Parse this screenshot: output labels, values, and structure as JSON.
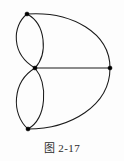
{
  "figure": {
    "caption_prefix": "图",
    "caption_chapter": "2",
    "caption_dash": "-",
    "caption_number": "17",
    "caption_full": "图 2-17",
    "background_color": "#fdfdfd",
    "ink_color": "#1a1a1a",
    "vertex_color": "#000000"
  },
  "chart_data": {
    "type": "diagram",
    "vertices": [
      {
        "id": "v_top",
        "label": "",
        "x": 27,
        "y": 14
      },
      {
        "id": "v_center",
        "label": "",
        "x": 35,
        "y": 68
      },
      {
        "id": "v_right",
        "label": "",
        "x": 110,
        "y": 68
      },
      {
        "id": "v_bottom",
        "label": "",
        "x": 28,
        "y": 129
      }
    ],
    "edges": [
      {
        "id": "e1",
        "from": "v_top",
        "to": "v_center",
        "shape": "arc-left",
        "path": "M 27 14 C 12 26 11 54 35 68"
      },
      {
        "id": "e2",
        "from": "v_top",
        "to": "v_center",
        "shape": "arc-right",
        "path": "M 27 14 C 46 24 48 54 35 68"
      },
      {
        "id": "e3",
        "from": "v_center",
        "to": "v_bottom",
        "shape": "arc-left",
        "path": "M 35 68 C 12 82 11 114 28 129"
      },
      {
        "id": "e4",
        "from": "v_center",
        "to": "v_bottom",
        "shape": "arc-right",
        "path": "M 35 68 C 48 84 47 118 28 129"
      },
      {
        "id": "e5",
        "from": "v_center",
        "to": "v_right",
        "shape": "straight",
        "path": "M 35 68 L 110 68"
      },
      {
        "id": "e6",
        "from": "v_top",
        "to": "v_right",
        "shape": "arc-outer-top",
        "path": "M 27 14 C 72 11 110 33 110 68"
      },
      {
        "id": "e7",
        "from": "v_right",
        "to": "v_bottom",
        "shape": "arc-outer-bot",
        "path": "M 110 68 C 110 106 70 129 28 129"
      }
    ],
    "vertex_count": 4,
    "edge_count": 7,
    "axis": {
      "grid": false,
      "legend": false
    }
  }
}
